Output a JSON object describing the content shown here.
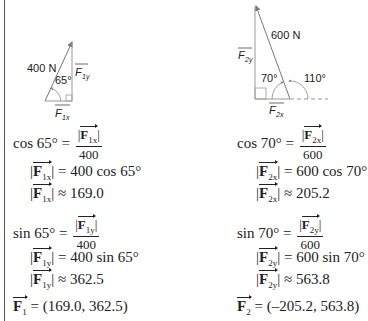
{
  "diagram_left": {
    "magnitude_label": "400 N",
    "angle_label": "65°",
    "vertical_label": "F",
    "vertical_sub": "1y",
    "horizontal_label": "F",
    "horizontal_sub": "1x"
  },
  "diagram_right": {
    "magnitude_label": "600 N",
    "inner_angle_label": "70°",
    "outer_angle_label": "110°",
    "vertical_label": "F",
    "vertical_sub": "2y",
    "horizontal_label": "F",
    "horizontal_sub": "2x"
  },
  "left": {
    "cos_lhs": "cos 65° =",
    "cos_num_sub": "1x",
    "cos_den": "400",
    "cos_step1_sub": "1x",
    "cos_step1_rhs": "= 400 cos 65°",
    "cos_step2_sub": "1x",
    "cos_step2_rhs": "≈ 169.0",
    "sin_lhs": "sin 65° =",
    "sin_num_sub": "1y",
    "sin_den": "400",
    "sin_step1_sub": "1y",
    "sin_step1_rhs": "= 400 sin 65°",
    "sin_step2_sub": "1y",
    "sin_step2_rhs": "≈ 362.5",
    "result_sub": "1",
    "result_rhs": "= (169.0, 362.5)"
  },
  "right": {
    "cos_lhs": "cos 70° =",
    "cos_num_sub": "2x",
    "cos_den": "600",
    "cos_step1_sub": "2x",
    "cos_step1_rhs": "= 600 cos 70°",
    "cos_step2_sub": "2x",
    "cos_step2_rhs": "≈ 205.2",
    "sin_lhs": "sin 70° =",
    "sin_num_sub": "2y",
    "sin_den": "600",
    "sin_step1_sub": "2y",
    "sin_step1_rhs": "= 600 sin 70°",
    "sin_step2_sub": "2y",
    "sin_step2_rhs": "≈ 563.8",
    "result_sub": "2",
    "result_rhs": "= (–205.2, 563.8)"
  },
  "symbols": {
    "F": "F",
    "bar": "|"
  }
}
